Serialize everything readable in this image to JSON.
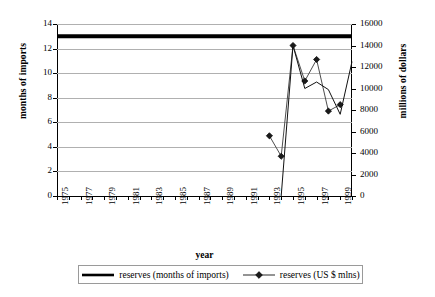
{
  "chart_data": {
    "type": "line",
    "title": "",
    "xlabel": "year",
    "ylabel": "months of imports",
    "y2label": "millions of dollars",
    "grid": true,
    "legend_position": "bottom",
    "xlim": [
      1975,
      2000
    ],
    "ylim": [
      0,
      14
    ],
    "y2lim": [
      0,
      16000
    ],
    "x_tick_labels": [
      "1975",
      "1977",
      "1979",
      "1981",
      "1983",
      "1985",
      "1987",
      "1989",
      "1991",
      "1993",
      "1995",
      "1997",
      "1999"
    ],
    "x_all_ticks": [
      1975,
      1976,
      1977,
      1978,
      1979,
      1980,
      1981,
      1982,
      1983,
      1984,
      1985,
      1986,
      1987,
      1988,
      1989,
      1990,
      1991,
      1992,
      1993,
      1994,
      1995,
      1996,
      1997,
      1998,
      1999,
      2000
    ],
    "y_tick_labels": [
      "0",
      "2",
      "4",
      "6",
      "8",
      "10",
      "12",
      "14"
    ],
    "y_tick_values": [
      0,
      2,
      4,
      6,
      8,
      10,
      12,
      14
    ],
    "y2_tick_labels": [
      "0",
      "2000",
      "4000",
      "6000",
      "8000",
      "10000",
      "12000",
      "14000",
      "16000"
    ],
    "y2_tick_values": [
      0,
      2000,
      4000,
      6000,
      8000,
      10000,
      12000,
      14000,
      16000
    ],
    "series": [
      {
        "name": "reserves (months of imports)",
        "axis": "left",
        "marker": "none",
        "linewidth": 4,
        "color": "#000000",
        "x": [
          1975,
          1976,
          1977,
          1978,
          1979,
          1980,
          1981,
          1982,
          1983,
          1984,
          1985,
          1986,
          1987,
          1988,
          1989,
          1990,
          1991,
          1992,
          1993,
          1994,
          1995,
          1996,
          1997,
          1998,
          1999,
          2000
        ],
        "values": [
          13,
          13,
          13,
          13,
          13,
          13,
          13,
          13,
          13,
          13,
          13,
          13,
          13,
          13,
          13,
          13,
          13,
          13,
          13,
          13,
          13,
          13,
          13,
          13,
          13,
          13
        ]
      },
      {
        "name": "reserves (US $ mlns)",
        "axis": "right",
        "marker": "diamond",
        "linewidth": 1,
        "color": "#4d4d4d",
        "x": [
          1993,
          1994,
          1995,
          1996,
          1997,
          1998,
          1999
        ],
        "values": [
          5600,
          3700,
          14000,
          10700,
          12700,
          7900,
          8500
        ]
      },
      {
        "name": "reserves (US $ mlns) secondary path",
        "axis": "right",
        "marker": "none",
        "linewidth": 1,
        "color": "#111111",
        "x": [
          1994,
          1995,
          1996,
          1997,
          1998,
          1999,
          2000
        ],
        "values": [
          0,
          14000,
          10000,
          10600,
          9900,
          7600,
          12500
        ]
      }
    ]
  },
  "legend": {
    "items": [
      {
        "label": "reserves (months of imports)",
        "key": "thick-line"
      },
      {
        "label": "reserves (US $ mlns)",
        "key": "diamond-line"
      }
    ]
  }
}
